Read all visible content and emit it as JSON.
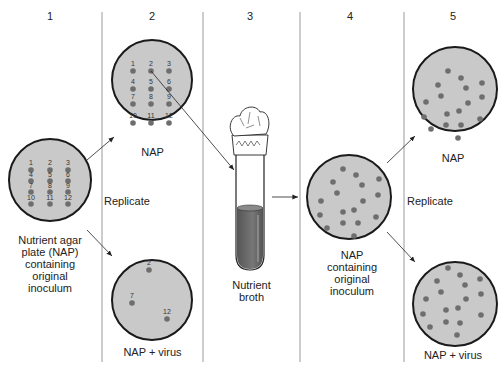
{
  "columns": [
    {
      "number": "1"
    },
    {
      "number": "2"
    },
    {
      "number": "3"
    },
    {
      "number": "4"
    },
    {
      "number": "5"
    }
  ],
  "step1": {
    "plate_label_lines": [
      "Nutrient agar",
      "plate (NAP)",
      "containing",
      "original",
      "inoculum"
    ],
    "colony_numbers": [
      "1",
      "2",
      "3",
      "4",
      "5",
      "6",
      "7",
      "8",
      "9",
      "10",
      "11",
      "12"
    ]
  },
  "step2": {
    "replicate_label": "Replicate",
    "top_plate_label": "NAP",
    "bottom_plate_label": "NAP + virus",
    "top_colony_numbers": [
      "1",
      "2",
      "3",
      "4",
      "5",
      "6",
      "7",
      "8",
      "9",
      "10",
      "11",
      "12"
    ],
    "bottom_colony_numbers": [
      "2",
      "7",
      "12"
    ]
  },
  "step3": {
    "tube_label_lines": [
      "Nutrient",
      "broth"
    ]
  },
  "step4": {
    "plate_label_lines": [
      "NAP",
      "containing",
      "original",
      "inoculum"
    ]
  },
  "step5": {
    "replicate_label": "Replicate",
    "top_plate_label": "NAP",
    "bottom_plate_label": "NAP + virus"
  },
  "colors": {
    "plate_fill": "#c9c9c9",
    "plate_border": "#1a1a1a",
    "colony": "#6e6e6e",
    "broth": "#6a6a6a",
    "divider": "#9a9a9a"
  }
}
